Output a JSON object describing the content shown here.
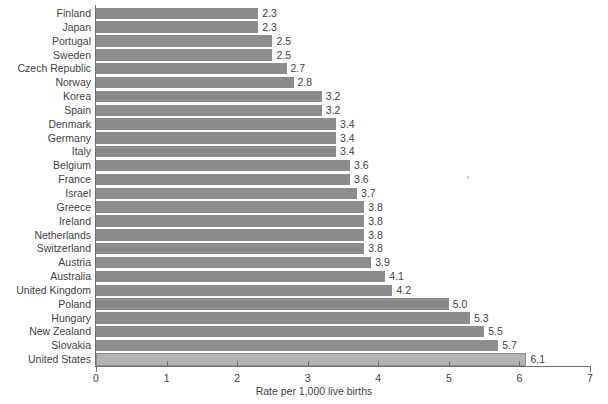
{
  "chart_data": {
    "type": "bar",
    "orientation": "horizontal",
    "title": "",
    "subtitle": "",
    "xlabel": "Rate per 1,000 live births",
    "ylabel": "",
    "xlim": [
      0,
      7
    ],
    "xticks": [
      0,
      1,
      2,
      3,
      4,
      5,
      6,
      7
    ],
    "xtick_labels": [
      "0",
      "1",
      "2",
      "3",
      "4",
      "5",
      "6",
      "7"
    ],
    "grid": false,
    "legend": null,
    "bar_color": "#8c8c8c",
    "highlight_color": "#b3b3b3",
    "highlight_category": "United States",
    "categories": [
      "Finland",
      "Japan",
      "Portugal",
      "Sweden",
      "Czech Republic",
      "Norway",
      "Korea",
      "Spain",
      "Denmark",
      "Germany",
      "Italy",
      "Belgium",
      "France",
      "Israel",
      "Greece",
      "Ireland",
      "Netherlands",
      "Switzerland",
      "Austria",
      "Australia",
      "United Kingdom",
      "Poland",
      "Hungary",
      "New Zealand",
      "Slovakia",
      "United States"
    ],
    "values": [
      2.3,
      2.3,
      2.5,
      2.5,
      2.7,
      2.8,
      3.2,
      3.2,
      3.4,
      3.4,
      3.4,
      3.6,
      3.6,
      3.7,
      3.8,
      3.8,
      3.8,
      3.8,
      3.9,
      4.1,
      4.2,
      5.0,
      5.3,
      5.5,
      5.7,
      6.1
    ],
    "value_labels": [
      "2.3",
      "2.3",
      "2.5",
      "2.5",
      "2.7",
      "2.8",
      "3.2",
      "3.2",
      "3.4",
      "3.4",
      "3.4",
      "3.6",
      "3.6",
      "3.7",
      "3.8",
      "3.8",
      "3.8",
      "3.8",
      "3.9",
      "4.1",
      "4.2",
      "5.0",
      "5.3",
      "5.5",
      "5.7",
      "6.1"
    ]
  }
}
